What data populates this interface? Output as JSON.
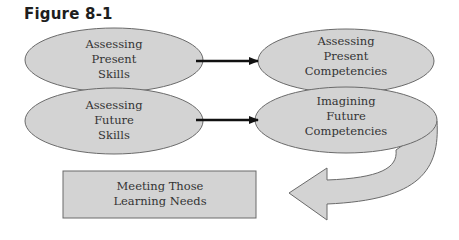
{
  "figure": {
    "title": "Figure 8-1",
    "nodes": [
      {
        "id": "assessing-present-skills",
        "label": "Assessing\nPresent\nSkills",
        "shape": "ellipse"
      },
      {
        "id": "assessing-future-skills",
        "label": "Assessing\nFuture\nSkills",
        "shape": "ellipse"
      },
      {
        "id": "assessing-present-competencies",
        "label": "Assessing\nPresent\nCompetencies",
        "shape": "ellipse"
      },
      {
        "id": "imagining-future-competencies",
        "label": "Imagining\nFuture\nCompetencies",
        "shape": "ellipse"
      },
      {
        "id": "meeting-learning-needs",
        "label": "Meeting Those\nLearning Needs",
        "shape": "rectangle"
      }
    ],
    "edges": [
      {
        "from": "assessing-present-skills",
        "to": "assessing-present-competencies",
        "style": "straight-arrow"
      },
      {
        "from": "assessing-future-skills",
        "to": "imagining-future-competencies",
        "style": "straight-arrow"
      },
      {
        "from": "imagining-future-competencies",
        "to": "meeting-learning-needs",
        "style": "curved-block-arrow"
      }
    ],
    "colors": {
      "fill": "#d3d3d3",
      "stroke": "#6a6a6a",
      "arrow": "#111111",
      "text": "#333333"
    }
  }
}
